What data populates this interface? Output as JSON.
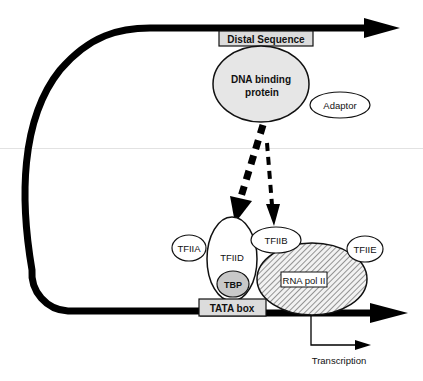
{
  "diagram": {
    "type": "transcription initiation complex",
    "labels": {
      "distal_sequence": "Distal Sequence",
      "dna_binding_protein_line1": "DNA binding",
      "dna_binding_protein_line2": "protein",
      "adaptor": "Adaptor",
      "tfiia": "TFIIA",
      "tfiid": "TFIID",
      "tfiib": "TFIIB",
      "tfiie": "TFIIE",
      "tbp": "TBP",
      "rna_pol_ii": "RNA pol II",
      "tata_box": "TATA box",
      "transcription": "Transcription"
    },
    "colors": {
      "dna_strand": "#000000",
      "protein_fill": "#e6e6e6",
      "tbp_fill": "#c8c8c8",
      "box_fill": "#dcdcdc",
      "outline": "#111111"
    }
  }
}
